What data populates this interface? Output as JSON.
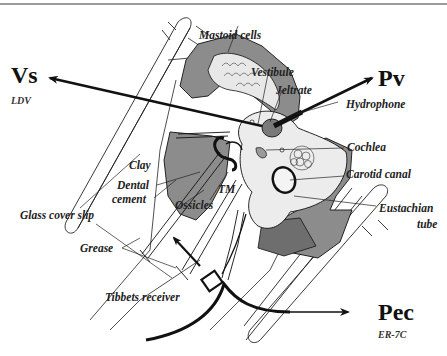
{
  "figure": {
    "type": "anatomical-measurement-setup-diagram",
    "colors": {
      "tissue_dark": "#8c8c8c",
      "tissue_light": "#e6e6e6",
      "line": "#111111",
      "background": "#ffffff"
    }
  },
  "signals": {
    "vs": {
      "label": "Vs",
      "sublabel": "LDV"
    },
    "pv": {
      "label": "Pv"
    },
    "pec": {
      "label": "Pec",
      "sublabel": "ER-7C"
    }
  },
  "labels": {
    "mastoid_cells": "Mastoid cells",
    "vestibule": "Vestibule",
    "jeltrate": "Jeltrate",
    "hydrophone": "Hydrophone",
    "cochlea": "Cochlea",
    "carotid_canal": "Carotid canal",
    "eustachian_tube_line1": "Eustachian",
    "eustachian_tube_line2": "tube",
    "clay": "Clay",
    "dental_cement_line1": "Dental",
    "dental_cement_line2": "cement",
    "tm": "TM",
    "ossicles": "Ossicles",
    "glass_cover_slip": "Glass cover slip",
    "grease": "Grease",
    "tibbets_receiver": "Tibbets receiver"
  }
}
